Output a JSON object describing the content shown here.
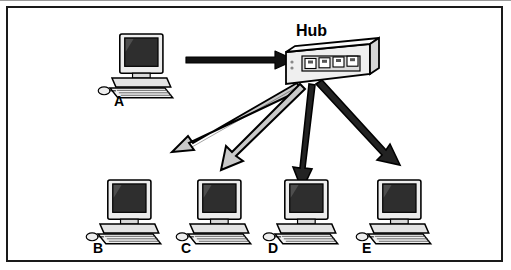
{
  "diagram": {
    "title": "",
    "type": "network-topology",
    "central_device": {
      "label": "Hub",
      "ports": 4
    },
    "nodes": [
      {
        "id": "A",
        "label": "A",
        "role": "workstation",
        "position": "top-left"
      },
      {
        "id": "B",
        "label": "B",
        "role": "workstation",
        "position": "bottom-1"
      },
      {
        "id": "C",
        "label": "C",
        "role": "workstation",
        "position": "bottom-2"
      },
      {
        "id": "D",
        "label": "D",
        "role": "workstation",
        "position": "bottom-3"
      },
      {
        "id": "E",
        "label": "E",
        "role": "workstation",
        "position": "bottom-4"
      }
    ],
    "connections": [
      {
        "from": "A",
        "to": "Hub",
        "style": "solid-arrow",
        "direction": "to-hub"
      },
      {
        "from": "Hub",
        "to": "B",
        "style": "outline-arrow",
        "direction": "from-hub"
      },
      {
        "from": "Hub",
        "to": "C",
        "style": "outline-arrow",
        "direction": "from-hub"
      },
      {
        "from": "Hub",
        "to": "D",
        "style": "outline-arrow",
        "direction": "from-hub"
      },
      {
        "from": "Hub",
        "to": "E",
        "style": "outline-arrow",
        "direction": "from-hub"
      }
    ],
    "colors": {
      "line": "#000000",
      "arrow_fill": "#c8c8c8",
      "frame": "#1a1a1a",
      "monitor_screen": "#2b2b2b",
      "case": "#e8e8e8",
      "background": "#ffffff"
    }
  }
}
